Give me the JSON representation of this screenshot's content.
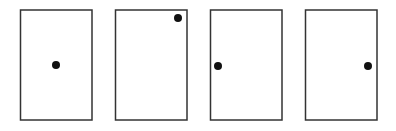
{
  "diagram": {
    "panels": [
      {
        "id": 1,
        "dot_position": "center"
      },
      {
        "id": 2,
        "dot_position": "top-right corner"
      },
      {
        "id": 3,
        "dot_position": "left-middle edge"
      },
      {
        "id": 4,
        "dot_position": "right-middle edge"
      }
    ],
    "colors": {
      "stroke": "#333333",
      "dot": "#111111",
      "background": "#ffffff"
    }
  }
}
